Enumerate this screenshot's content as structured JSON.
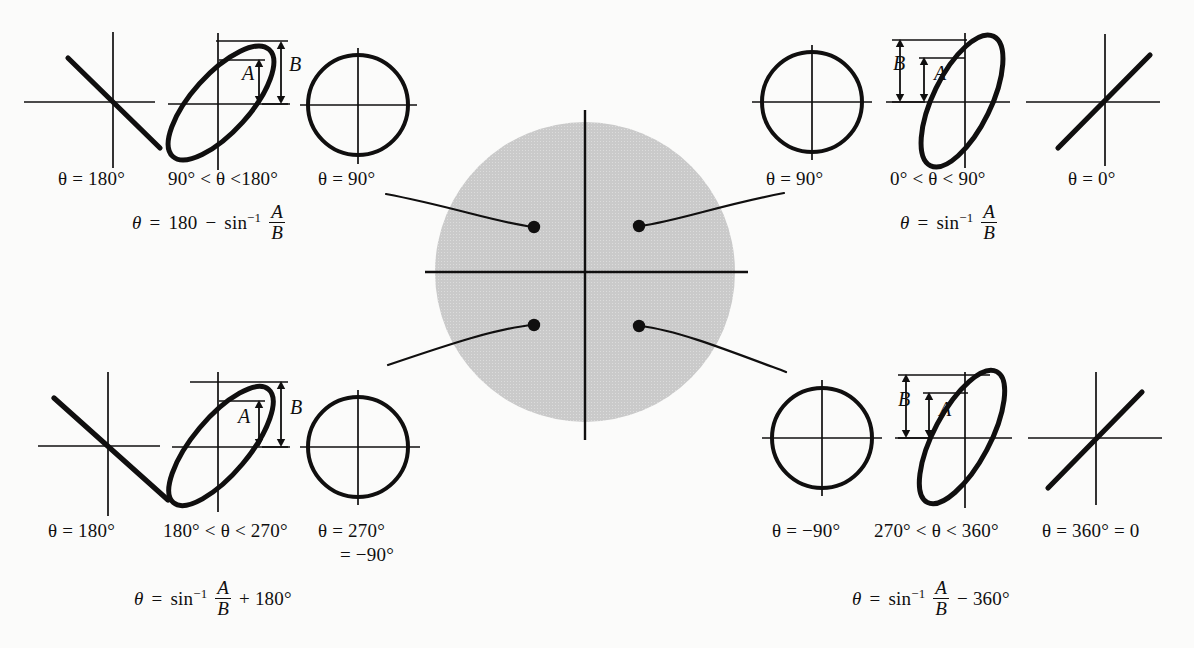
{
  "figure": {
    "background_color": "#fbfbfa",
    "ink_color": "#100f0f",
    "shaded_circle_color": "#c9c9c9"
  },
  "center_circle": {
    "name": "shaded-quadrant-circle",
    "axes": [
      "vertical-axis",
      "horizontal-axis"
    ],
    "quadrant_dots": 4
  },
  "quadrants": [
    {
      "id": "q2",
      "position": "top-left",
      "panels": [
        {
          "type": "line",
          "label": "θ = 180°"
        },
        {
          "type": "ellipse",
          "label": "90° < θ <180°"
        },
        {
          "type": "circle",
          "label": "θ = 90°"
        }
      ],
      "formula": {
        "lhs": "θ",
        "eq": "=",
        "term1": "180",
        "operator": "−",
        "fn": "sin",
        "fn_exponent": "−1",
        "frac_num": "A",
        "frac_den": "B",
        "tail": ""
      },
      "markers": [
        "A",
        "B"
      ]
    },
    {
      "id": "q1",
      "position": "top-right",
      "panels": [
        {
          "type": "circle",
          "label": "θ = 90°"
        },
        {
          "type": "ellipse",
          "label": "0° < θ < 90°"
        },
        {
          "type": "line",
          "label": "θ = 0°"
        }
      ],
      "formula": {
        "lhs": "θ",
        "eq": "=",
        "term1": "",
        "operator": "",
        "fn": "sin",
        "fn_exponent": "−1",
        "frac_num": "A",
        "frac_den": "B",
        "tail": ""
      },
      "markers": [
        "B",
        "A"
      ]
    },
    {
      "id": "q3",
      "position": "bottom-left",
      "panels": [
        {
          "type": "line",
          "label": "θ = 180°"
        },
        {
          "type": "ellipse",
          "label": "180° < θ < 270°"
        },
        {
          "type": "circle",
          "label": "θ = 270°",
          "label2": "= −90°"
        }
      ],
      "formula": {
        "lhs": "θ",
        "eq": "=",
        "term1": "",
        "operator": "",
        "fn": "sin",
        "fn_exponent": "−1",
        "frac_num": "A",
        "frac_den": "B",
        "tail": "+ 180°"
      },
      "markers": [
        "A",
        "B"
      ]
    },
    {
      "id": "q4",
      "position": "bottom-right",
      "panels": [
        {
          "type": "circle",
          "label": "θ = −90°"
        },
        {
          "type": "ellipse",
          "label": "270° < θ < 360°"
        },
        {
          "type": "line",
          "label": "θ = 360° = 0"
        }
      ],
      "formula": {
        "lhs": "θ",
        "eq": "=",
        "term1": "",
        "operator": "",
        "fn": "sin",
        "fn_exponent": "−1",
        "frac_num": "A",
        "frac_den": "B",
        "tail": "− 360°"
      },
      "markers": [
        "B",
        "A"
      ]
    }
  ],
  "labels": {
    "tl_line": "θ = 180°",
    "tl_ellipse": "90° < θ <180°",
    "tl_circle": "θ = 90°",
    "tr_circle": "θ = 90°",
    "tr_ellipse": "0° < θ < 90°",
    "tr_line": "θ = 0°",
    "bl_line": "θ = 180°",
    "bl_ellipse": "180° < θ < 270°",
    "bl_circle": "θ = 270°",
    "bl_circle_second": "= −90°",
    "br_circle": "θ = −90°",
    "br_ellipse": "270° < θ < 360°",
    "br_line": "θ = 360° = 0",
    "marker_a": "A",
    "marker_b": "B",
    "theta": "θ",
    "equals": "=",
    "sin": "sin",
    "inverse_exp": "−1",
    "num_180": "180",
    "minus": "−",
    "plus_180deg": "+ 180°",
    "minus_360deg": "− 360°",
    "num_A": "A",
    "den_B": "B"
  }
}
